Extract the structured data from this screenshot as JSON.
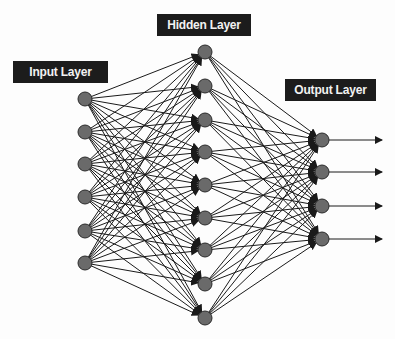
{
  "diagram": {
    "colors": {
      "background": "#fdfdfd",
      "edge": "#1a1a1a",
      "node_fill": "#6a6a6a",
      "node_stroke": "#2a2a2a",
      "label_bg": "#1c1c1c",
      "label_text": "#f2f2f2"
    },
    "node_radius": 7,
    "layers": [
      {
        "name": "input",
        "label": "Input Layer",
        "label_box": {
          "x": 13,
          "y": 61,
          "w": 95
        },
        "x": 85,
        "nodes_y": [
          99,
          132,
          164,
          197,
          231,
          263
        ]
      },
      {
        "name": "hidden",
        "label": "Hidden Layer",
        "label_box": {
          "x": 157,
          "y": 14,
          "w": 94
        },
        "x": 205,
        "nodes_y": [
          52,
          86,
          120,
          152,
          185,
          218,
          250,
          284,
          318
        ]
      },
      {
        "name": "output",
        "label": "Output Layer",
        "label_box": {
          "x": 285,
          "y": 79,
          "w": 91
        },
        "x": 322,
        "nodes_y": [
          140,
          172,
          206,
          239
        ]
      }
    ],
    "output_arrows": {
      "end_x": 382
    }
  }
}
